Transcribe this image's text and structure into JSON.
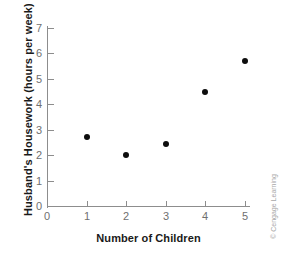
{
  "chart_data": {
    "type": "scatter",
    "title": "",
    "xlabel": "Number of Children",
    "ylabel": "Husband's Housework (hours per week)",
    "x": [
      1,
      2,
      3,
      4,
      5
    ],
    "values": [
      2.7,
      2.0,
      2.45,
      4.5,
      5.7
    ],
    "points": [
      {
        "x": 1,
        "y": 2.7
      },
      {
        "x": 2,
        "y": 2.0
      },
      {
        "x": 3,
        "y": 2.45
      },
      {
        "x": 4,
        "y": 4.5
      },
      {
        "x": 5,
        "y": 5.7
      }
    ],
    "xlim": [
      0,
      5
    ],
    "ylim": [
      0,
      7
    ],
    "xticks": [
      "0",
      "1",
      "2",
      "3",
      "4",
      "5"
    ],
    "yticks": [
      "0",
      "1",
      "2",
      "3",
      "4",
      "5",
      "6",
      "7"
    ],
    "grid": false,
    "legend": false,
    "marker_color": "#0d0d0d",
    "axis_color": "#8d8d8d",
    "tick_label_color": "#6f6f6f",
    "axis_title_color": "#1a1a1a"
  },
  "credit": {
    "text": "© Cengage Learning"
  }
}
